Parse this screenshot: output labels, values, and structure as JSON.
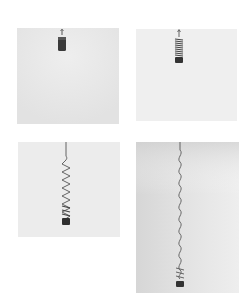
{
  "figure": {
    "panels": [
      {
        "id": 1,
        "stage": "compressed",
        "x": 17,
        "y": 28,
        "w": 102,
        "h": 96,
        "bg": "#e9e9e9"
      },
      {
        "id": 2,
        "stage": "slightly-extended",
        "x": 136,
        "y": 29,
        "w": 101,
        "h": 92,
        "bg": "#efefef"
      },
      {
        "id": 3,
        "stage": "half-extended",
        "x": 18,
        "y": 142,
        "w": 102,
        "h": 95,
        "bg": "#ececec"
      },
      {
        "id": 4,
        "stage": "fully-extended",
        "x": 136,
        "y": 142,
        "w": 103,
        "h": 151,
        "bg": "#e4e4e4"
      }
    ]
  }
}
